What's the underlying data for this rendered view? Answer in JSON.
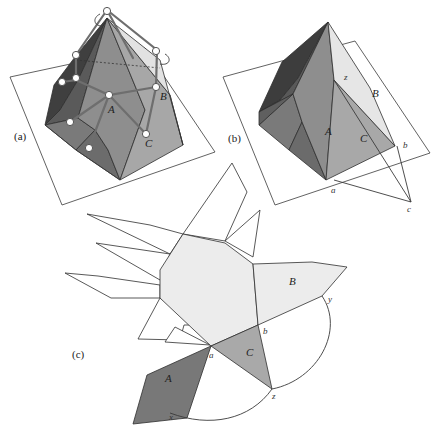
{
  "figure": {
    "panels": [
      {
        "id": "a",
        "label": "(a)",
        "description": "Convex polyhedron resting on a plane with its unfolding tree (graph of vertices and edges) drawn over the faces"
      },
      {
        "id": "b",
        "label": "(b)",
        "description": "Polyhedron with faces A, B, C sharing vertex z, cut along edges to points a, b, c on the plane"
      },
      {
        "id": "c",
        "label": "(c)",
        "description": "Unfolded net of the polyhedron with faces A, B, C laid flat and arcs connecting x, y, z"
      }
    ],
    "face_labels": {
      "A": "A",
      "B": "B",
      "C": "C"
    },
    "point_labels": {
      "a": "a",
      "b": "b",
      "c": "c",
      "x": "x",
      "y": "y",
      "z": "z"
    },
    "colors": {
      "face_dark": "#4a4a4a",
      "face_darker": "#3a3a3a",
      "face_mid": "#8c8c8c",
      "face_mid2": "#7b7b7b",
      "face_light": "#a9a9a9",
      "face_lighter": "#c9c9c9",
      "face_pale": "#e6e6e6",
      "net_fill": "#ececec",
      "face_A_net": "#7a7a7a",
      "face_C_net": "#ababab",
      "graph_stroke": "#6e6e6e"
    }
  }
}
